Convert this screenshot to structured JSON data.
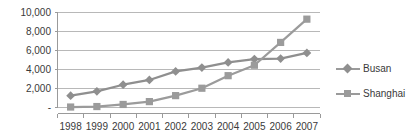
{
  "chart_data": {
    "type": "line",
    "title": "",
    "xlabel": "",
    "ylabel": "",
    "categories": [
      "1998",
      "1999",
      "2000",
      "2001",
      "2002",
      "2003",
      "2004",
      "2005",
      "2006",
      "2007"
    ],
    "ylim": [
      0,
      10000
    ],
    "yticks": [
      0,
      2000,
      4000,
      6000,
      8000,
      10000
    ],
    "ytick_labels": [
      "-",
      "2,000",
      "4,000",
      "6,000",
      "8,000",
      "10,000"
    ],
    "grid": true,
    "legend_position": "right",
    "series": [
      {
        "name": "Busan",
        "marker": "diamond",
        "color": "#8f8f8f",
        "values": [
          1250,
          1700,
          2400,
          2900,
          3800,
          4200,
          4750,
          5100,
          5150,
          5750
        ]
      },
      {
        "name": "Shanghai",
        "marker": "square",
        "color": "#9b9b9b",
        "values": [
          50,
          100,
          320,
          620,
          1250,
          2030,
          3350,
          4450,
          6850,
          9300
        ]
      }
    ]
  },
  "legend": {
    "items": [
      {
        "label": "Busan"
      },
      {
        "label": "Shanghai"
      }
    ]
  },
  "colors": {
    "series_busan": "#8f8f8f",
    "series_shanghai": "#9b9b9b",
    "grid": "#b8b8b8",
    "axis": "#9a9a9a",
    "text": "#3a3a3a"
  }
}
